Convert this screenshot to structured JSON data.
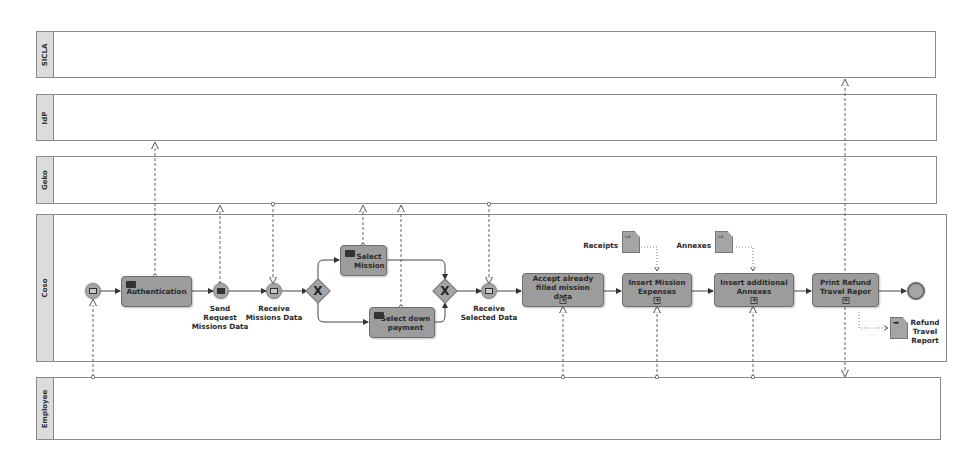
{
  "pools": [
    {
      "name": "SICLA",
      "label": "SICLA"
    },
    {
      "name": "IdP",
      "label": "IdP"
    },
    {
      "name": "Geko",
      "label": "Geko"
    },
    {
      "name": "Coso",
      "label": "Coso"
    },
    {
      "name": "Employee",
      "label": "Employee"
    }
  ],
  "tasks": {
    "authentication": "Authentication",
    "select_mission": "Select Mission",
    "select_down_payment": "Select down payment",
    "accept_filled": "Accept already filled mission data",
    "insert_expenses": "Insert Mission Expenses",
    "insert_annexes": "Insert additional Annexes",
    "print_refund": "Print Refund Travel Repor"
  },
  "events": {
    "send_request_l1": "Send",
    "send_request_l2": "Request",
    "send_request_l3": "Missions Data",
    "receive_missions_l1": "Receive",
    "receive_missions_l2": "Missions Data",
    "receive_selected_l1": "Receive",
    "receive_selected_l2": "Selected Data"
  },
  "gateways": {
    "split": "X",
    "join": "X"
  },
  "data_objects": {
    "receipts": "Receipts",
    "annexes": "Annexes",
    "refund_l1": "Refund",
    "refund_l2": "Travel",
    "refund_l3": "Report"
  },
  "markers": {
    "subprocess": "+"
  }
}
